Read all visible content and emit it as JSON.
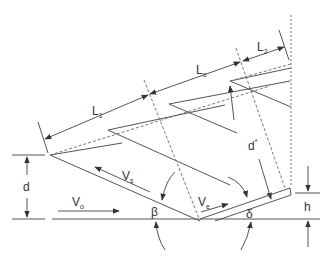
{
  "diagram": {
    "type": "technical-schematic",
    "colors": {
      "line": "#555555",
      "text": "#333333",
      "background": "#ffffff"
    },
    "labels": {
      "L1": {
        "main": "L",
        "sub": "1"
      },
      "Lo": {
        "main": "L",
        "sub": "o"
      },
      "L2": {
        "main": "L",
        "sub": "2"
      },
      "d_star": {
        "main": "d",
        "sup": "*"
      },
      "d": {
        "main": "d"
      },
      "Vs": {
        "main": "V",
        "sub": "s"
      },
      "Vo": {
        "main": "V",
        "sub": "o"
      },
      "Ve": {
        "main": "V",
        "sub": "e"
      },
      "beta": {
        "main": "β"
      },
      "delta": {
        "main": "δ"
      },
      "h": {
        "main": "h"
      }
    }
  }
}
